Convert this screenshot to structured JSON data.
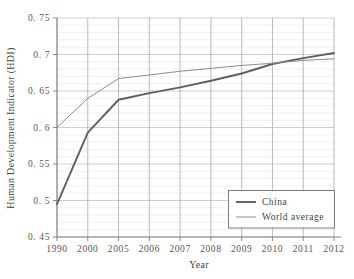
{
  "chart_data": {
    "type": "line",
    "title": "",
    "xlabel": "Year",
    "ylabel": "Human Development Indicator (HDI)",
    "categories": [
      "1990",
      "2000",
      "2005",
      "2006",
      "2007",
      "2008",
      "2009",
      "2010",
      "2011",
      "2012"
    ],
    "ylim": [
      0.45,
      0.75
    ],
    "y_major_ticks": [
      0.45,
      0.5,
      0.55,
      0.6,
      0.65,
      0.7,
      0.75
    ],
    "y_major_tick_labels": [
      "0. 45",
      "0. 5",
      "0. 55",
      "0. 6",
      "0. 65",
      "0. 7",
      "0. 75"
    ],
    "y_minor_step": 0.01,
    "grid": {
      "horizontal_major": true,
      "horizontal_minor": true,
      "vertical": true
    },
    "legend": {
      "position": "bottom-right",
      "entries": [
        {
          "name": "China",
          "color": "#5f5f5f",
          "width": 1.9
        },
        {
          "name": "World average",
          "color": "#8d8d8d",
          "width": 1.0
        }
      ]
    },
    "series": [
      {
        "name": "China",
        "color": "#5f5f5f",
        "width": 1.9,
        "values": [
          0.495,
          0.593,
          0.638,
          0.647,
          0.655,
          0.664,
          0.674,
          0.687,
          0.695,
          0.702
        ]
      },
      {
        "name": "World average",
        "color": "#8d8d8d",
        "width": 1.0,
        "values": [
          0.6,
          0.64,
          0.667,
          0.672,
          0.677,
          0.681,
          0.685,
          0.688,
          0.692,
          0.694
        ]
      }
    ]
  },
  "axes": {
    "x_label": "Year",
    "y_label": "Human Development Indicator (HDI)"
  },
  "legend": {
    "china_label": "China",
    "world_label": "World average"
  },
  "ticks": {
    "y": [
      "0. 75",
      "0. 7",
      "0. 65",
      "0. 6",
      "0. 55",
      "0. 5",
      "0. 45"
    ],
    "x": [
      "1990",
      "2000",
      "2005",
      "2006",
      "2007",
      "2008",
      "2009",
      "2010",
      "2011",
      "2012"
    ]
  }
}
